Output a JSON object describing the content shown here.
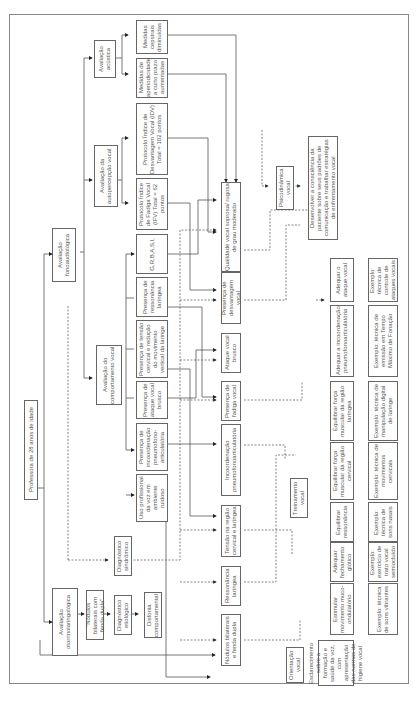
{
  "root": "Professora de 28 anos de idade",
  "level1": {
    "fono": "Avaliação fonoaudiológica",
    "otorrino": "Avaliação otorrinolaringológica"
  },
  "level2": {
    "acustica": "Avaliação acústica",
    "autopercepcao": "Avaliação da autopercepção vocal",
    "comportamento": "Avaliação do comportamento vocal",
    "nodulos_diag": "\"Nódulos bilaterais com fenda dupla\"",
    "diag_etiologico": "Diagnóstico etiológico",
    "disfonia": "Disfonia comportamental",
    "diag_sindromico": "Diagnóstico sindrômico"
  },
  "findings": {
    "cepstrais": "Medidas cepstrais diminuídas",
    "aperiodicidade": "Medidas de aperiodicidade a curto prazo aumentadas",
    "idv": "Protocolo Índice de Desvantagem Vocal (IDV) Total = 102 pontos",
    "ifv": "Protocolo Índice de Fadiga Vocal (IFV) Total = 62 pontos",
    "grbasi": "G,R,B,A,S,I,",
    "ressonancia": "Presença de ressonância laríngea",
    "tensao": "Presença de tensão cervical e redução do movimento vertical da laringe",
    "ataque": "Presença de ataque vocal brusco",
    "incoord": "Presença de incoordenação pneumofono-articulatória",
    "uso": "Uso profissional da voz em ambiente ruidoso"
  },
  "problems": {
    "qualidade": "Qualidade vocal soprosa/ rugosa de grau moderado",
    "desvantagem": "Presença de desvantagem vocal",
    "ataque_brusco": "Ataque vocal brusco",
    "fadiga": "Presença de fadiga vocal",
    "incoord": "Incoordenação pneumofonoarticulatória",
    "tensao_regiao": "Tensão na região cervical e laríngea",
    "ressonancia_lar": "Ressonância laríngea",
    "nodulos": "Nódulos bilaterais e fenda dupla"
  },
  "approaches": {
    "psicodinamica": "Psicodinâmica vocal",
    "treinamento": "Treinamento vocal",
    "orientacao": "Orientação vocal"
  },
  "goals": {
    "consciencia": "Desenvolver a consciência da paciente sobre seus padrões de comunicação e trabalhar estratégias de enfrentamento vocal",
    "ataque": "Adequar o ataque vocal",
    "incoord": "Adequar a incoordenação pneumofonoarticulatória",
    "forca_laringe": "Equilibrar força muscular da região laríngea",
    "forca_cervical": "Equilibrar força muscular da região cervical",
    "ressonancia": "Equilibrar ressonância",
    "fechamento": "Adequar fechamento glótico",
    "muco": "Estimular movimento muco-ondulatório",
    "esclarecimento": "Esclarecimento sobre a formação e saúde da voz, com apresentação das normas de higiene vocal"
  },
  "examples": {
    "ataque": "Exemplo: técnica de controle de ataques vocais",
    "incoord": "Exemplo: técnica de emissão em Tempo Máximo de Fonação",
    "laringe": "Exemplo: técnica de manipulação digital de laringe",
    "cervical": "Exemplo: técnica de movimentos cervicais",
    "nasais": "Exemplo: técnica de sons nasais",
    "trato": "Exemplo: exercício de trato vocal semiocluído",
    "vibrantes": "Exemplo: técnica de sons vibrantes"
  }
}
